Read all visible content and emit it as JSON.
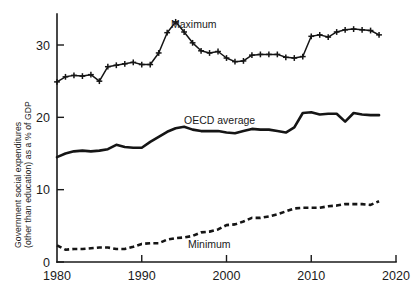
{
  "chart_data": {
    "type": "line",
    "title": "",
    "subtitle": "",
    "xlabel": "",
    "ylabel_line1": "Government social expenditures",
    "ylabel_line2": "(other than education) as a % of GDP",
    "xlim": [
      1980,
      2020
    ],
    "ylim": [
      0,
      34
    ],
    "xticks": [
      1980,
      1990,
      2000,
      2010,
      2020
    ],
    "xtick_labels": [
      "1980",
      "1990",
      "2000",
      "2010",
      "2020"
    ],
    "yticks": [
      0,
      10,
      20,
      30
    ],
    "ytick_labels": [
      "0",
      "10",
      "20",
      "30"
    ],
    "grid": false,
    "legend_position": "inline-annotations",
    "x": [
      1980,
      1981,
      1982,
      1983,
      1984,
      1985,
      1986,
      1987,
      1988,
      1989,
      1990,
      1991,
      1992,
      1993,
      1994,
      1995,
      1996,
      1997,
      1998,
      1999,
      2000,
      2001,
      2002,
      2003,
      2004,
      2005,
      2006,
      2007,
      2008,
      2009,
      2010,
      2011,
      2012,
      2013,
      2014,
      2015,
      2016,
      2017,
      2018
    ],
    "series": [
      {
        "name": "Maximum",
        "style": "line-with-plus-markers",
        "annotation": "Maximum",
        "values": [
          24.9,
          25.6,
          25.8,
          25.7,
          25.9,
          25.0,
          27.0,
          27.2,
          27.4,
          27.6,
          27.3,
          27.3,
          28.9,
          31.7,
          33.2,
          31.8,
          30.3,
          29.2,
          28.9,
          29.1,
          28.2,
          27.7,
          27.8,
          28.6,
          28.7,
          28.7,
          28.7,
          28.3,
          28.2,
          28.4,
          31.2,
          31.4,
          31.1,
          31.8,
          32.1,
          32.2,
          32.1,
          32.0,
          31.4
        ]
      },
      {
        "name": "OECD average",
        "style": "solid-thick-line",
        "annotation": "OECD average",
        "values": [
          14.5,
          15.0,
          15.3,
          15.4,
          15.3,
          15.4,
          15.6,
          16.2,
          15.9,
          15.8,
          15.8,
          16.6,
          17.3,
          18.0,
          18.5,
          18.7,
          18.3,
          18.1,
          18.1,
          18.1,
          17.9,
          17.8,
          18.1,
          18.4,
          18.3,
          18.3,
          18.1,
          17.9,
          18.6,
          20.6,
          20.7,
          20.4,
          20.5,
          20.5,
          19.4,
          20.6,
          20.4,
          20.3,
          20.3
        ]
      },
      {
        "name": "Minimum",
        "style": "dashed-thick-line",
        "annotation": "Minimum",
        "values": [
          2.3,
          1.7,
          1.8,
          1.8,
          1.9,
          2.0,
          2.0,
          1.8,
          1.8,
          2.1,
          2.5,
          2.6,
          2.6,
          3.1,
          3.3,
          3.4,
          3.6,
          4.1,
          4.2,
          4.5,
          5.1,
          5.2,
          5.6,
          6.1,
          6.1,
          6.3,
          6.6,
          7.0,
          7.4,
          7.5,
          7.5,
          7.5,
          7.7,
          7.8,
          8.0,
          8.0,
          8.0,
          7.9,
          8.4
        ]
      }
    ]
  },
  "annotations": {
    "maximum_label": "Maximum",
    "oecd_label": "OECD average",
    "minimum_label": "Minimum"
  }
}
